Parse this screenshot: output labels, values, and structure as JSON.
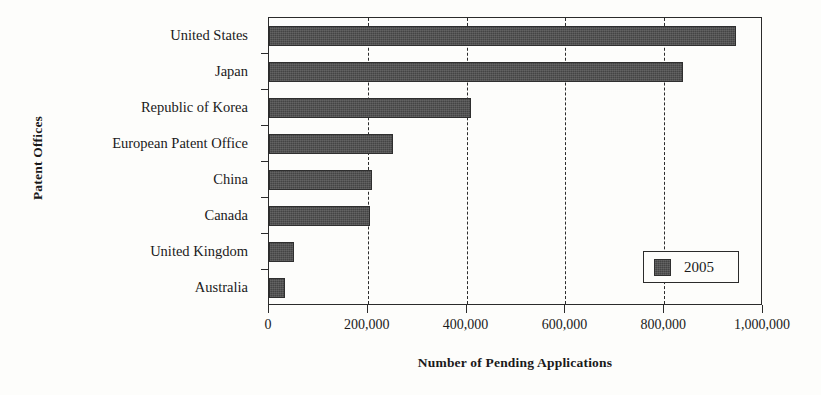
{
  "chart_data": {
    "type": "bar",
    "orientation": "horizontal",
    "title": "",
    "xlabel": "Number of Pending Applications",
    "ylabel": "Patent Offices",
    "categories": [
      "United States",
      "Japan",
      "Republic of Korea",
      "European Patent Office",
      "China",
      "Canada",
      "United Kingdom",
      "Australia"
    ],
    "series": [
      {
        "name": "2005",
        "values": [
          945000,
          838000,
          408000,
          250000,
          208000,
          205000,
          50000,
          33000
        ],
        "color": "#444444"
      }
    ],
    "xlim": [
      0,
      1000000
    ],
    "xticks": [
      0,
      200000,
      400000,
      600000,
      800000,
      1000000
    ],
    "xtick_labels": [
      "0",
      "200,000",
      "400,000",
      "600,000",
      "800,000",
      "1,000,000"
    ],
    "grid": "vertical-dashed",
    "legend": {
      "position": "bottom-right",
      "entries": [
        {
          "label": "2005",
          "color": "#444444"
        }
      ]
    }
  }
}
